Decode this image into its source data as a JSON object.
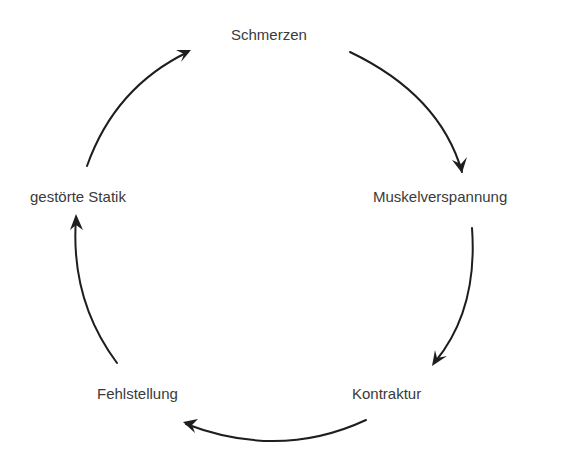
{
  "diagram": {
    "type": "cycle",
    "nodes": [
      {
        "id": "schmerzen",
        "label": "Schmerzen"
      },
      {
        "id": "muskelverspannung",
        "label": "Muskelverspannung"
      },
      {
        "id": "kontraktur",
        "label": "Kontraktur"
      },
      {
        "id": "fehlstellung",
        "label": "Fehlstellung"
      },
      {
        "id": "gestoerte-statik",
        "label": "gestörte Statik"
      }
    ],
    "edges": [
      {
        "from": "Schmerzen",
        "to": "Muskelverspannung"
      },
      {
        "from": "Muskelverspannung",
        "to": "Kontraktur"
      },
      {
        "from": "Kontraktur",
        "to": "Fehlstellung"
      },
      {
        "from": "Fehlstellung",
        "to": "gestörte Statik"
      },
      {
        "from": "gestörte Statik",
        "to": "Schmerzen"
      }
    ],
    "stroke_color": "#1e1e1e",
    "text_color": "#3a3a3a"
  }
}
